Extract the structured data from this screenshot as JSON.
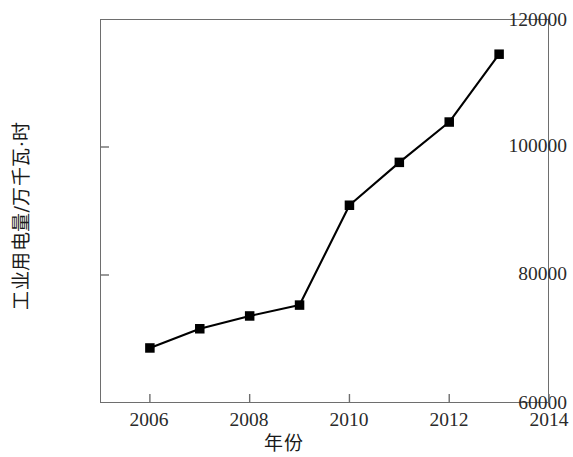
{
  "chart_data": {
    "type": "line",
    "title": "",
    "xlabel": "年份",
    "ylabel": "工业用电量/万千瓦·时",
    "x": [
      2006,
      2007,
      2008,
      2009,
      2010,
      2011,
      2012,
      2013
    ],
    "values": [
      68600,
      71600,
      73600,
      75300,
      90900,
      97600,
      103900,
      114500
    ],
    "series": [
      {
        "name": "工业用电量",
        "values": [
          68600,
          71600,
          73600,
          75300,
          90900,
          97600,
          103900,
          114500
        ]
      }
    ],
    "xlim": [
      2005,
      2014
    ],
    "ylim": [
      60000,
      120000
    ],
    "xticks": [
      2006,
      2008,
      2010,
      2012,
      2014
    ],
    "xtick_labels": [
      "2006",
      "2008",
      "2010",
      "2012",
      "2014"
    ],
    "yticks": [
      60000,
      80000,
      100000,
      120000
    ],
    "ytick_labels": [
      "60000",
      "80000",
      "100000",
      "120000"
    ],
    "grid": false,
    "legend": false,
    "legend_position": "none",
    "marker": "square",
    "marker_color": "#000000",
    "line_color": "#000000",
    "frame_color": "#6e6e6e",
    "background_color": "#ffffff"
  }
}
